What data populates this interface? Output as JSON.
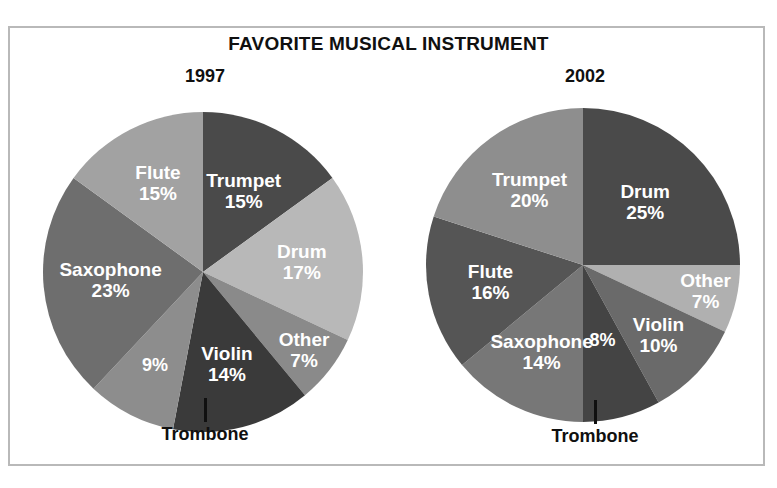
{
  "figure": {
    "title": "FAVORITE MUSICAL INSTRUMENT",
    "background": "#ffffff",
    "frame_color": "#b9b9b9",
    "label_color": "#ffffff",
    "text_color": "#101010"
  },
  "panels": [
    {
      "year": "1997",
      "callout_label": "Trombone"
    },
    {
      "year": "2002",
      "callout_label": "Trombone"
    }
  ],
  "chart_data": [
    {
      "type": "pie",
      "title": "1997",
      "labels": [
        "Trumpet",
        "Drum",
        "Other",
        "Violin",
        "Trombone",
        "Saxophone",
        "Flute"
      ],
      "values": [
        15,
        17,
        7,
        14,
        9,
        23,
        15
      ],
      "value_suffix": "%",
      "display_labels": [
        "Trumpet 15%",
        "Drum 17%",
        "Other 7%",
        "Violin 14%",
        "9%",
        "Saxophone 23%",
        "Flute 15%"
      ],
      "colors": [
        "#4a4a4a",
        "#b8b8b8",
        "#8a8a8a",
        "#3a3a3a",
        "#8d8d8d",
        "#6e6e6e",
        "#a2a2a2"
      ],
      "start_angle_deg": 0,
      "direction": "clockwise",
      "legend": "none",
      "labels_inside": true,
      "external_label": {
        "slice": "Trombone",
        "text": "Trombone",
        "value_text": "9%"
      }
    },
    {
      "type": "pie",
      "title": "2002",
      "labels": [
        "Drum",
        "Other",
        "Violin",
        "Trombone",
        "Saxophone",
        "Flute",
        "Trumpet"
      ],
      "values": [
        25,
        7,
        10,
        8,
        14,
        16,
        20
      ],
      "value_suffix": "%",
      "display_labels": [
        "Drum 25%",
        "Other 7%",
        "Violin 10%",
        "8%",
        "Saxophone 14%",
        "Flute 16%",
        "Trumpet 20%"
      ],
      "colors": [
        "#4a4a4a",
        "#b0b0b0",
        "#6a6a6a",
        "#444444",
        "#777777",
        "#555555",
        "#8e8e8e"
      ],
      "start_angle_deg": 0,
      "direction": "clockwise",
      "legend": "none",
      "labels_inside": true,
      "external_label": {
        "slice": "Trombone",
        "text": "Trombone",
        "value_text": "8%"
      }
    }
  ]
}
